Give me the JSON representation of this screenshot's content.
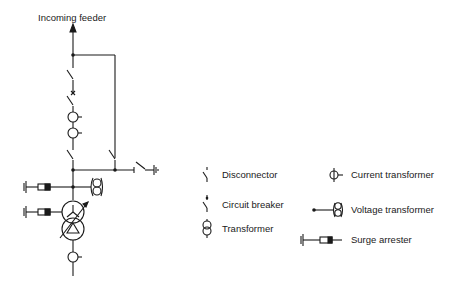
{
  "diagram": {
    "title": "Incoming feeder",
    "type": "single-line electrical diagram",
    "components": [
      "incoming feeder arrow",
      "disconnector",
      "circuit breaker",
      "current transformer",
      "current transformer",
      "busbar disconnector",
      "bypass disconnector",
      "earthing switch",
      "voltage transformer",
      "surge arrester",
      "power transformer with on-load tap changer (star-delta)",
      "surge arrester",
      "current transformer"
    ]
  },
  "legend": {
    "items": [
      {
        "symbol": "disconnector-icon",
        "label": "Disconnector"
      },
      {
        "symbol": "circuit-breaker-icon",
        "label": "Circuit breaker"
      },
      {
        "symbol": "transformer-icon",
        "label": "Transformer"
      },
      {
        "symbol": "current-transformer-icon",
        "label": "Current transformer"
      },
      {
        "symbol": "voltage-transformer-icon",
        "label": "Voltage transformer"
      },
      {
        "symbol": "surge-arrester-icon",
        "label": "Surge arrester"
      }
    ]
  },
  "colors": {
    "line": "#1a1a1a",
    "background": "#ffffff"
  }
}
